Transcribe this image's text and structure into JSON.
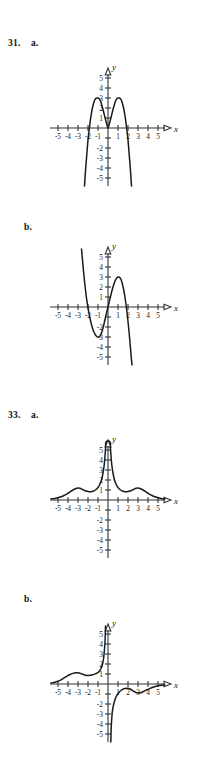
{
  "page": {
    "background": "#ffffff",
    "width": 217,
    "height": 765,
    "ink_color": "#1a1a1a",
    "axis_color": "#333333"
  },
  "problems": [
    {
      "number": "31.",
      "parts": [
        {
          "letter": "a."
        },
        {
          "letter": "b."
        }
      ]
    },
    {
      "number": "33.",
      "parts": [
        {
          "letter": "a."
        },
        {
          "letter": "b."
        }
      ]
    }
  ],
  "axes": {
    "x_name": "x",
    "y_name": "y",
    "x_tick_labels": [
      "-5",
      "-4",
      "-3",
      "-2",
      "-1",
      "1",
      "2",
      "3",
      "4",
      "5"
    ],
    "y_tick_labels_positive": [
      "1",
      "2",
      "3",
      "4",
      "5"
    ],
    "y_tick_labels_negative": [
      "-2",
      "-3",
      "-4",
      "-5"
    ],
    "x_range": [
      -5.8,
      5.8
    ],
    "y_range": [
      -5.8,
      5.8
    ],
    "unit_px": 10,
    "grid": false
  },
  "chart_data": [
    {
      "id": "graph-31a",
      "type": "line",
      "title": "31. a.",
      "xlabel": "x",
      "ylabel": "y",
      "xlim": [
        -5.8,
        5.8
      ],
      "ylim": [
        -5.8,
        5.8
      ],
      "grid": false,
      "legend": "none",
      "description": "Two symmetric parabolic humps peaking near y=3 at x=-1 and x=1, meeting in a sharp cusp at the origin and plunging steeply below y=-5 outside x=+/-2.",
      "series": [
        {
          "name": "curve",
          "points": [
            [
              -2.35,
              -5.8
            ],
            [
              -2.25,
              -4.3
            ],
            [
              -2.1,
              -2.4
            ],
            [
              -2.0,
              -1.2
            ],
            [
              -1.9,
              -0.3
            ],
            [
              -1.8,
              0.5
            ],
            [
              -1.7,
              1.2
            ],
            [
              -1.6,
              1.8
            ],
            [
              -1.5,
              2.25
            ],
            [
              -1.4,
              2.6
            ],
            [
              -1.3,
              2.85
            ],
            [
              -1.2,
              2.96
            ],
            [
              -1.1,
              3.0
            ],
            [
              -1.0,
              3.0
            ],
            [
              -0.9,
              2.95
            ],
            [
              -0.8,
              2.8
            ],
            [
              -0.7,
              2.55
            ],
            [
              -0.6,
              2.2
            ],
            [
              -0.5,
              1.85
            ],
            [
              -0.4,
              1.45
            ],
            [
              -0.3,
              1.05
            ],
            [
              -0.2,
              0.68
            ],
            [
              -0.12,
              0.38
            ],
            [
              -0.05,
              0.12
            ],
            [
              0.0,
              0.0
            ],
            [
              0.05,
              0.12
            ],
            [
              0.12,
              0.38
            ],
            [
              0.2,
              0.68
            ],
            [
              0.3,
              1.05
            ],
            [
              0.4,
              1.45
            ],
            [
              0.5,
              1.85
            ],
            [
              0.6,
              2.2
            ],
            [
              0.7,
              2.55
            ],
            [
              0.8,
              2.8
            ],
            [
              0.9,
              2.95
            ],
            [
              1.0,
              3.0
            ],
            [
              1.1,
              3.0
            ],
            [
              1.2,
              2.96
            ],
            [
              1.3,
              2.85
            ],
            [
              1.4,
              2.6
            ],
            [
              1.5,
              2.25
            ],
            [
              1.6,
              1.8
            ],
            [
              1.7,
              1.2
            ],
            [
              1.8,
              0.5
            ],
            [
              1.9,
              -0.3
            ],
            [
              2.0,
              -1.2
            ],
            [
              2.1,
              -2.4
            ],
            [
              2.25,
              -4.3
            ],
            [
              2.35,
              -5.8
            ]
          ]
        }
      ]
    },
    {
      "id": "graph-31b",
      "type": "line",
      "title": "31. b.",
      "xlabel": "x",
      "ylabel": "y",
      "xlim": [
        -5.8,
        5.8
      ],
      "ylim": [
        -5.8,
        5.8
      ],
      "grid": false,
      "legend": "none",
      "description": "Cubic-like curve falling from upper left, crossing the x-axis near x=-2, local minimum about (-1,-3), rising through the origin, local maximum about (1,3), crossing near x=2 and falling steeply below y=-5.",
      "series": [
        {
          "name": "curve",
          "points": [
            [
              -2.65,
              5.8
            ],
            [
              -2.55,
              4.7
            ],
            [
              -2.45,
              3.6
            ],
            [
              -2.35,
              2.6
            ],
            [
              -2.25,
              1.7
            ],
            [
              -2.15,
              0.9
            ],
            [
              -2.05,
              0.25
            ],
            [
              -1.95,
              -0.35
            ],
            [
              -1.85,
              -0.9
            ],
            [
              -1.75,
              -1.35
            ],
            [
              -1.6,
              -1.95
            ],
            [
              -1.45,
              -2.4
            ],
            [
              -1.3,
              -2.72
            ],
            [
              -1.15,
              -2.92
            ],
            [
              -1.0,
              -3.0
            ],
            [
              -0.9,
              -2.98
            ],
            [
              -0.8,
              -2.9
            ],
            [
              -0.7,
              -2.72
            ],
            [
              -0.6,
              -2.45
            ],
            [
              -0.5,
              -2.1
            ],
            [
              -0.4,
              -1.7
            ],
            [
              -0.3,
              -1.25
            ],
            [
              -0.2,
              -0.8
            ],
            [
              -0.1,
              -0.4
            ],
            [
              0.0,
              0.0
            ],
            [
              0.1,
              0.42
            ],
            [
              0.2,
              0.85
            ],
            [
              0.3,
              1.25
            ],
            [
              0.4,
              1.65
            ],
            [
              0.5,
              2.0
            ],
            [
              0.6,
              2.32
            ],
            [
              0.7,
              2.58
            ],
            [
              0.8,
              2.78
            ],
            [
              0.9,
              2.92
            ],
            [
              1.0,
              3.0
            ],
            [
              1.1,
              3.0
            ],
            [
              1.2,
              2.92
            ],
            [
              1.3,
              2.75
            ],
            [
              1.4,
              2.45
            ],
            [
              1.5,
              2.05
            ],
            [
              1.6,
              1.55
            ],
            [
              1.7,
              0.95
            ],
            [
              1.8,
              0.25
            ],
            [
              1.9,
              -0.55
            ],
            [
              2.0,
              -1.45
            ],
            [
              2.1,
              -2.45
            ],
            [
              2.2,
              -3.55
            ],
            [
              2.3,
              -4.75
            ],
            [
              2.4,
              -5.8
            ]
          ]
        }
      ]
    },
    {
      "id": "graph-33a",
      "type": "line",
      "title": "33. a.",
      "xlabel": "x",
      "ylabel": "y",
      "xlim": [
        -5.8,
        5.8
      ],
      "ylim": [
        -5.8,
        5.8
      ],
      "grid": false,
      "legend": "none",
      "description": "Even bell-like function, flat near zero at the far edges, small bumps of height about 1.2 at x=-3 and x=3, dipping slightly near x=+/-1.7, then a tall narrow spike at the origin rising past y=5 off the top of the plot.",
      "series": [
        {
          "name": "curve",
          "points": [
            [
              -5.7,
              0.12
            ],
            [
              -5.3,
              0.16
            ],
            [
              -5.0,
              0.22
            ],
            [
              -4.7,
              0.32
            ],
            [
              -4.4,
              0.45
            ],
            [
              -4.1,
              0.62
            ],
            [
              -3.8,
              0.82
            ],
            [
              -3.5,
              1.0
            ],
            [
              -3.2,
              1.15
            ],
            [
              -3.0,
              1.2
            ],
            [
              -2.8,
              1.17
            ],
            [
              -2.6,
              1.08
            ],
            [
              -2.4,
              0.98
            ],
            [
              -2.2,
              0.9
            ],
            [
              -2.0,
              0.85
            ],
            [
              -1.8,
              0.83
            ],
            [
              -1.6,
              0.85
            ],
            [
              -1.4,
              0.92
            ],
            [
              -1.2,
              1.05
            ],
            [
              -1.0,
              1.25
            ],
            [
              -0.85,
              1.5
            ],
            [
              -0.7,
              1.85
            ],
            [
              -0.6,
              2.2
            ],
            [
              -0.5,
              2.7
            ],
            [
              -0.42,
              3.2
            ],
            [
              -0.35,
              3.8
            ],
            [
              -0.3,
              4.4
            ],
            [
              -0.25,
              5.1
            ],
            [
              -0.2,
              5.8
            ],
            [
              0.2,
              5.8
            ],
            [
              0.25,
              5.1
            ],
            [
              0.3,
              4.4
            ],
            [
              0.35,
              3.8
            ],
            [
              0.42,
              3.2
            ],
            [
              0.5,
              2.7
            ],
            [
              0.6,
              2.2
            ],
            [
              0.7,
              1.85
            ],
            [
              0.85,
              1.5
            ],
            [
              1.0,
              1.25
            ],
            [
              1.2,
              1.05
            ],
            [
              1.4,
              0.92
            ],
            [
              1.6,
              0.85
            ],
            [
              1.8,
              0.83
            ],
            [
              2.0,
              0.85
            ],
            [
              2.2,
              0.9
            ],
            [
              2.4,
              0.98
            ],
            [
              2.6,
              1.08
            ],
            [
              2.8,
              1.17
            ],
            [
              3.0,
              1.2
            ],
            [
              3.2,
              1.15
            ],
            [
              3.5,
              1.0
            ],
            [
              3.8,
              0.82
            ],
            [
              4.1,
              0.62
            ],
            [
              4.4,
              0.45
            ],
            [
              4.7,
              0.32
            ],
            [
              5.0,
              0.22
            ],
            [
              5.3,
              0.16
            ],
            [
              5.7,
              0.12
            ]
          ]
        }
      ]
    },
    {
      "id": "graph-33b",
      "type": "line",
      "title": "33. b.",
      "xlabel": "x",
      "ylabel": "y",
      "xlim": [
        -5.8,
        5.8
      ],
      "ylim": [
        -5.8,
        5.8
      ],
      "grid": false,
      "legend": "none",
      "description": "Odd-symmetric derivative-style curve in two branches: the left branch rises from near zero at x=-5, bumps to about y=1.1 near x=-3, dips slightly near x=-2, then climbs steeply off the top of the plot just left of the origin; the right branch comes up from below y=-5 just right of the origin, rises toward the axis with a shallow dip near x=3, and flattens toward zero at x=5.",
      "series": [
        {
          "name": "left-branch",
          "points": [
            [
              -5.7,
              0.1
            ],
            [
              -5.3,
              0.18
            ],
            [
              -5.0,
              0.28
            ],
            [
              -4.7,
              0.42
            ],
            [
              -4.4,
              0.6
            ],
            [
              -4.1,
              0.78
            ],
            [
              -3.8,
              0.95
            ],
            [
              -3.5,
              1.06
            ],
            [
              -3.2,
              1.12
            ],
            [
              -3.0,
              1.12
            ],
            [
              -2.8,
              1.08
            ],
            [
              -2.6,
              1.0
            ],
            [
              -2.4,
              0.93
            ],
            [
              -2.2,
              0.88
            ],
            [
              -2.0,
              0.86
            ],
            [
              -1.8,
              0.87
            ],
            [
              -1.6,
              0.9
            ],
            [
              -1.4,
              0.96
            ],
            [
              -1.2,
              1.05
            ],
            [
              -1.0,
              1.15
            ],
            [
              -0.85,
              1.3
            ],
            [
              -0.7,
              1.55
            ],
            [
              -0.6,
              1.8
            ],
            [
              -0.52,
              2.1
            ],
            [
              -0.45,
              2.5
            ],
            [
              -0.4,
              2.95
            ],
            [
              -0.35,
              3.5
            ],
            [
              -0.3,
              4.2
            ],
            [
              -0.27,
              5.0
            ],
            [
              -0.25,
              5.8
            ]
          ]
        },
        {
          "name": "right-branch",
          "points": [
            [
              0.28,
              -5.8
            ],
            [
              0.3,
              -5.0
            ],
            [
              0.33,
              -4.2
            ],
            [
              0.37,
              -3.5
            ],
            [
              0.42,
              -2.9
            ],
            [
              0.5,
              -2.35
            ],
            [
              0.6,
              -1.9
            ],
            [
              0.72,
              -1.5
            ],
            [
              0.85,
              -1.2
            ],
            [
              1.0,
              -0.95
            ],
            [
              1.15,
              -0.78
            ],
            [
              1.3,
              -0.65
            ],
            [
              1.5,
              -0.52
            ],
            [
              1.7,
              -0.45
            ],
            [
              1.9,
              -0.42
            ],
            [
              2.1,
              -0.45
            ],
            [
              2.3,
              -0.55
            ],
            [
              2.5,
              -0.68
            ],
            [
              2.7,
              -0.8
            ],
            [
              2.9,
              -0.88
            ],
            [
              3.0,
              -0.9
            ],
            [
              3.2,
              -0.88
            ],
            [
              3.4,
              -0.82
            ],
            [
              3.6,
              -0.72
            ],
            [
              3.9,
              -0.58
            ],
            [
              4.2,
              -0.44
            ],
            [
              4.5,
              -0.32
            ],
            [
              4.8,
              -0.23
            ],
            [
              5.2,
              -0.15
            ],
            [
              5.7,
              -0.1
            ]
          ]
        }
      ]
    }
  ],
  "layout": {
    "panels": [
      {
        "chart_index": 0,
        "top": 36,
        "label_top": 38,
        "axis_center_x": 108,
        "axis_center_y": 128
      },
      {
        "chart_index": 1,
        "top": 220,
        "label_top": 222,
        "axis_center_x": 108,
        "axis_center_y": 307
      },
      {
        "chart_index": 2,
        "top": 408,
        "label_top": 410,
        "axis_center_x": 108,
        "axis_center_y": 500
      },
      {
        "chart_index": 3,
        "top": 592,
        "label_top": 594,
        "axis_center_x": 108,
        "axis_center_y": 684
      }
    ]
  }
}
